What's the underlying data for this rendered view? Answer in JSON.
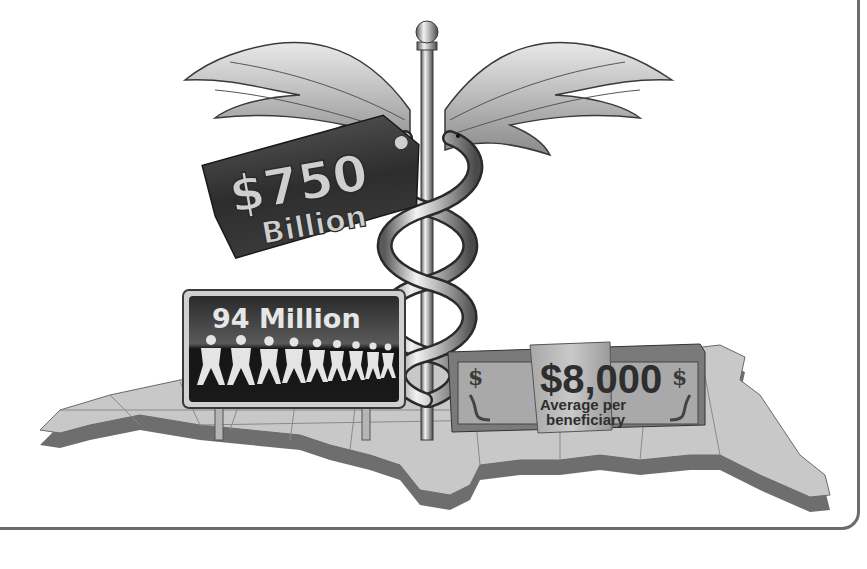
{
  "illustration": {
    "subject": "caduceus-over-us-map",
    "price_tag": {
      "amount": "$750",
      "unit": "Billion",
      "color": "#3a3a3a"
    },
    "billboard": {
      "title": "94 Million",
      "people_icon_count": 9,
      "color": "#1e1e1e"
    },
    "money_stack": {
      "amount": "$8,000",
      "label_line1": "Average per",
      "label_line2": "beneficiary",
      "band_color": "#bdbdbd"
    },
    "map": {
      "top_color": "#c8c8c8",
      "side_color": "#6e6e6e"
    },
    "frame_color": "#6b6b6b"
  }
}
